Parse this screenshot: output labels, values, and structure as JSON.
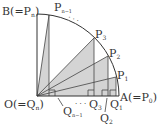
{
  "diagram": {
    "type": "quarter-circle-partition",
    "origin": {
      "label": "O(=Q",
      "sub": "n",
      "close": ")"
    },
    "point_B": {
      "label": "B(=P",
      "sub": "n",
      "close": ")"
    },
    "point_A": {
      "label": "A(=P",
      "sub": "0",
      "close": ")"
    },
    "arc_points": [
      {
        "label": "P",
        "sub": "1"
      },
      {
        "label": "P",
        "sub": "2"
      },
      {
        "label": "P",
        "sub": "3"
      },
      {
        "label": "P",
        "sub": "n−1"
      }
    ],
    "foot_points": [
      {
        "label": "Q",
        "sub": "1"
      },
      {
        "label": "Q",
        "sub": "2"
      },
      {
        "label": "Q",
        "sub": "3"
      },
      {
        "label": "Q",
        "sub": "n−1"
      }
    ],
    "ellipsis_arc": "· · ·",
    "ellipsis_base": "· · ·",
    "colors": {
      "shade": "#d4d4d4",
      "line": "#333333",
      "background": "#ffffff"
    }
  }
}
